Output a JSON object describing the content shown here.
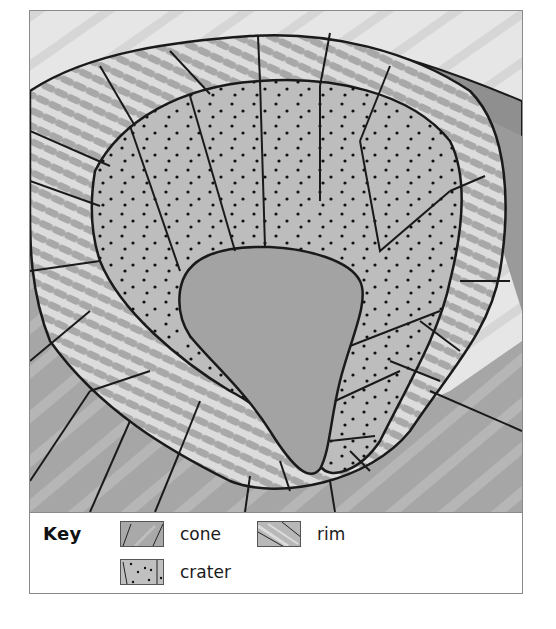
{
  "figure": {
    "regions": [
      {
        "id": "cone",
        "label": "cone",
        "pattern": "solid grey with thin straight lines",
        "color": "#a9a9a9"
      },
      {
        "id": "crater",
        "label": "crater",
        "pattern": "grey with black dots",
        "color": "#bdbdbd"
      },
      {
        "id": "rim",
        "label": "rim",
        "pattern": "light grey with brush strokes",
        "color": "#c8c8c8"
      }
    ]
  },
  "key": {
    "title": "Key",
    "items": [
      {
        "name": "cone",
        "label": "cone"
      },
      {
        "name": "rim",
        "label": "rim"
      },
      {
        "name": "crater",
        "label": "crater"
      }
    ]
  },
  "colors": {
    "outline": "#1a1a1a",
    "cone_fill": "#a8a8a8",
    "crater_fill": "#bcbcbc",
    "rim_fill": "#cacaca",
    "rim_stroke": "#9e9e9e",
    "background_light": "#e2e2e2",
    "center_fill": "#a3a3a3"
  }
}
